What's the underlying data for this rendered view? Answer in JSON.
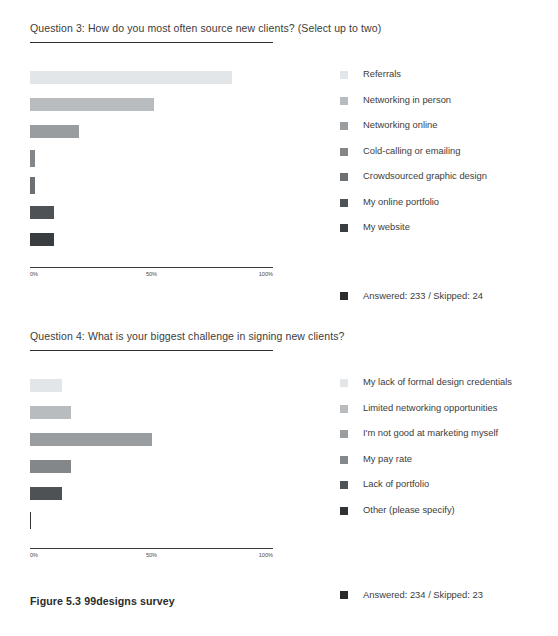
{
  "figure": {
    "caption": "Figure 5.3 99designs survey"
  },
  "palette": {
    "shade_1": "#e3e6e8",
    "shade_2": "#b9bcbf",
    "shade_3": "#9a9da0",
    "shade_4": "#84878a",
    "shade_5": "#6d7073",
    "shade_6": "#4f5255",
    "shade_7": "#3a3d40",
    "axis": "#3a3a3a",
    "text": "#3c3c3c"
  },
  "questions": [
    {
      "id": "q3",
      "title": "Question 3: How do you most often source new clients? (Select up to two)",
      "answered_text": "Answered: 233 / Skipped: 24",
      "answered_count": 233,
      "skipped_count": 24,
      "chart_data": {
        "type": "bar",
        "orientation": "horizontal",
        "title": "Question 3: How do you most often source new clients? (Select up to two)",
        "xlabel": "",
        "ylabel": "",
        "xlim": [
          0,
          100
        ],
        "grid": false,
        "legend_position": "right",
        "tick_labels": [
          "0%",
          "50%",
          "100%"
        ],
        "categories": [
          "Referrals",
          "Networking in person",
          "Networking online",
          "Cold-calling or emailing",
          "Crowdsourced graphic design",
          "My online portfolio",
          "My website"
        ],
        "values": [
          83,
          51,
          20,
          2,
          2,
          10,
          10
        ],
        "colors": [
          "#e3e6e8",
          "#b9bcbf",
          "#9a9da0",
          "#84878a",
          "#6d7073",
          "#4f5255",
          "#3a3d40"
        ]
      }
    },
    {
      "id": "q4",
      "title": "Question 4: What is your biggest challenge in signing new clients?",
      "answered_text": "Answered: 234 / Skipped: 23",
      "answered_count": 234,
      "skipped_count": 23,
      "chart_data": {
        "type": "bar",
        "orientation": "horizontal",
        "title": "Question 4: What is your biggest challenge in signing new clients?",
        "xlabel": "",
        "ylabel": "",
        "xlim": [
          0,
          100
        ],
        "grid": false,
        "legend_position": "right",
        "tick_labels": [
          "0%",
          "50%",
          "100%"
        ],
        "categories": [
          "My lack of formal design credentials",
          "Limited networking opportunities",
          "I'm not good at marketing myself",
          "My pay rate",
          "Lack of portfolio",
          "Other (please specify)"
        ],
        "values": [
          13,
          17,
          50,
          17,
          13,
          1
        ],
        "colors": [
          "#e3e6e8",
          "#b9bcbf",
          "#9a9da0",
          "#84878a",
          "#4f5255",
          "#2f3235"
        ]
      }
    }
  ]
}
